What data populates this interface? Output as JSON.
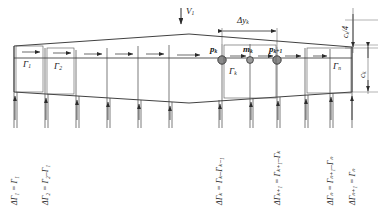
{
  "figure": {
    "type": "vortex-lattice-wing-diagram",
    "colors": {
      "line": "#2b2b2b",
      "thin_line": "#555555",
      "node_fill": "#8a8a8a",
      "node_stroke": "#333333",
      "background": "#ffffff"
    }
  },
  "labels": {
    "freestream_velocity": "V",
    "freestream_velocity_sub": "1",
    "panel_width": "Δy",
    "panel_width_sub": "k",
    "quarter_chord": "c",
    "quarter_chord_sub": "k",
    "quarter_chord_frac": "/4",
    "chord": "c",
    "chord_sub": "k"
  },
  "bound_vortices": [
    {
      "name": "gamma-1",
      "text": "Γ",
      "sub": "1"
    },
    {
      "name": "gamma-2",
      "text": "Γ",
      "sub": "2"
    },
    {
      "name": "gamma-k",
      "text": "Γ",
      "sub": "k"
    },
    {
      "name": "gamma-n",
      "text": "Γ",
      "sub": "n"
    }
  ],
  "nodes": [
    {
      "name": "point-pk",
      "text": "p",
      "sub": "k"
    },
    {
      "name": "point-mk",
      "text": "m",
      "sub": "k"
    },
    {
      "name": "point-pk1",
      "text": "p",
      "sub": "k+1"
    }
  ],
  "trailing_vortex_equations": [
    {
      "name": "delta-gamma-1",
      "text": "ΔΓ₁ = Γ₁"
    },
    {
      "name": "delta-gamma-2",
      "text": "ΔΓ₂ = Γ₂–Γ₁"
    },
    {
      "name": "delta-gamma-k",
      "text": "ΔΓₖ = Γₖ–Γₖ₋₁"
    },
    {
      "name": "delta-gamma-k1",
      "text": "ΔΓₖ₊₁ = Γₖ₊₁–Γₖ"
    },
    {
      "name": "delta-gamma-n",
      "text": "ΔΓₙ = Γₙ₊₁–Γₙ"
    },
    {
      "name": "delta-gamma-n1",
      "text": "ΔΓₙ₊₁ = Γₙ"
    }
  ]
}
